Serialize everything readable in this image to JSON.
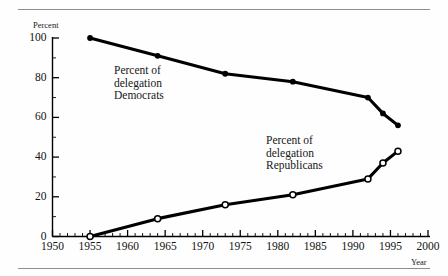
{
  "figure": {
    "background_color": "#fefefe",
    "line_color": "#000000",
    "rule_color": "#8e8e8e"
  },
  "axes": {
    "y_axis_name": "Percent",
    "x_axis_name": "Year",
    "y_tick_labels": [
      "0",
      "20",
      "40",
      "60",
      "80",
      "100"
    ],
    "x_tick_labels": [
      "1950",
      "1955",
      "1960",
      "1965",
      "1970",
      "1975",
      "1980",
      "1985",
      "1990",
      "1995",
      "2000"
    ]
  },
  "annotations": {
    "democrats_line1": "Percent of",
    "democrats_line2": "delegation",
    "democrats_line3": "Democrats",
    "republicans_line1": "Percent of",
    "republicans_line2": "delegation",
    "republicans_line3": "Republicans"
  },
  "chart_data": {
    "type": "line",
    "title": "",
    "subtitle": "",
    "xlabel": "Year",
    "ylabel": "Percent",
    "xlim": [
      1950,
      2000
    ],
    "ylim": [
      0,
      100
    ],
    "x_major_ticks": [
      1950,
      1955,
      1960,
      1965,
      1970,
      1975,
      1980,
      1985,
      1990,
      1995,
      2000
    ],
    "x_minor_tick_interval": 1,
    "y_major_ticks": [
      0,
      20,
      40,
      60,
      80,
      100
    ],
    "y_minor_tick_interval": 10,
    "grid": false,
    "legend_position": "inline-annotation",
    "series": [
      {
        "name": "Percent of delegation Democrats",
        "marker": "filled-circle",
        "x": [
          1955,
          1964,
          1973,
          1982,
          1992,
          1994,
          1996
        ],
        "values": [
          100,
          91,
          82,
          78,
          70,
          62,
          56
        ]
      },
      {
        "name": "Percent of delegation Republicans",
        "marker": "open-circle",
        "x": [
          1955,
          1964,
          1973,
          1982,
          1992,
          1994,
          1996
        ],
        "values": [
          0,
          9,
          16,
          21,
          29,
          37,
          43
        ]
      }
    ]
  }
}
